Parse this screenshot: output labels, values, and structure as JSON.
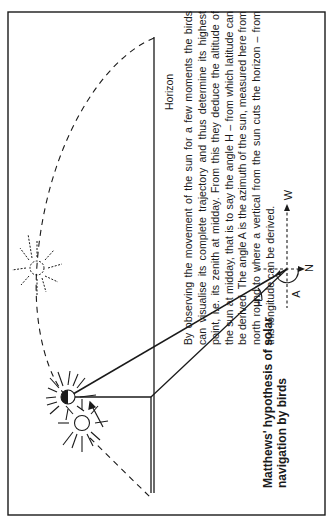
{
  "figure": {
    "caption": "Matthews' hypothesis of solar navigation by birds",
    "body_text": "By observing the movement of the sun for a few moments the birds can visualise its complete trajectory and thus determine its highest point, i.e. its zenith at midday. From this they deduce the altitude of the sun at midday, that is to say the angle H – from which latitude can be derived. The angle A is the azimuth of the sun, measured here from north round to where a vertical from the sun cuts the horizon – from this longitude can be derived.",
    "labels": {
      "horizon": "Horizon",
      "angle_altitude": "H",
      "angle_azimuth": "A",
      "direction_west": "W",
      "direction_north": "N"
    },
    "elements": {
      "sun_zenith": "sun at midday zenith",
      "sun_observed": "sun observed position",
      "sun_dashed": "extrapolated sun position",
      "trajectory": "dashed sun trajectory",
      "observer": "bird observer position"
    },
    "colors": {
      "ink": "#1a1a1a",
      "paper": "#ffffff"
    }
  }
}
